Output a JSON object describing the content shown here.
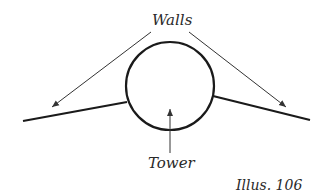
{
  "diagram": {
    "labels": {
      "walls": "Walls",
      "tower": "Tower",
      "caption": "Illus. 106"
    },
    "shapes": {
      "tower_circle": {
        "cx": 170,
        "cy": 86,
        "r": 44
      },
      "left_wall": {
        "x1": 23,
        "y1": 121,
        "x2": 127,
        "y2": 102
      },
      "right_wall": {
        "x1": 213,
        "y1": 96,
        "x2": 310,
        "y2": 120
      }
    },
    "colors": {
      "stroke": "#1a1a1a",
      "arrow": "#333333"
    }
  }
}
